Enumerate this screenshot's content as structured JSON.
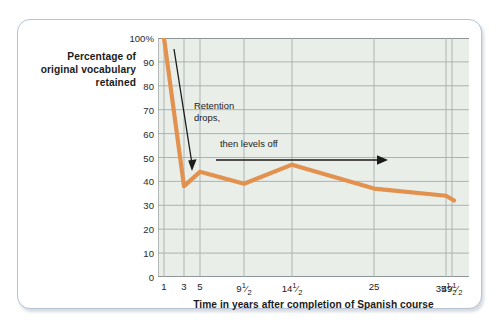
{
  "figure": {
    "y_axis_title": "Percentage of\noriginal vocabulary\nretained",
    "x_axis_title": "Time in years after completion of Spanish course",
    "annotations": [
      {
        "name": "retention-drops",
        "text": "Retention\ndrops,",
        "arrow": "down-right-arrow"
      },
      {
        "name": "then-levels-off",
        "text": "then levels off",
        "arrow": "right-arrow"
      }
    ],
    "colors": {
      "line": "#e2914f",
      "plot_background": "#e9eee8",
      "gridline": "#9aa3a4",
      "axis": "#8d9596",
      "card_border": "#b6c3d4",
      "annotation": "#1b1b1b"
    }
  },
  "chart_data": {
    "type": "line",
    "title": "",
    "xlabel": "Time in years after completion of Spanish course",
    "ylabel": "Percentage of original vocabulary retained",
    "ylim": [
      0,
      100
    ],
    "yticks": [
      "0",
      "10",
      "20",
      "30",
      "40",
      "50",
      "60",
      "70",
      "80",
      "90",
      "100%"
    ],
    "ytick_values": [
      0,
      10,
      20,
      30,
      40,
      50,
      60,
      70,
      80,
      90,
      100
    ],
    "xticks": [
      "1",
      "3",
      "5",
      "9½",
      "14½",
      "25",
      "35½",
      "49½"
    ],
    "xtick_values": [
      1,
      3,
      5,
      9.5,
      14.5,
      25,
      35.5,
      49.5
    ],
    "grid": true,
    "legend": "none",
    "x": [
      1,
      3,
      5,
      9.5,
      14.5,
      25,
      35.5,
      49.5
    ],
    "values": [
      100,
      38,
      44,
      39,
      47,
      37,
      34,
      32
    ],
    "series": [
      {
        "name": "Original vocabulary retained",
        "values": [
          100,
          38,
          44,
          39,
          47,
          37,
          34,
          32
        ]
      }
    ]
  }
}
